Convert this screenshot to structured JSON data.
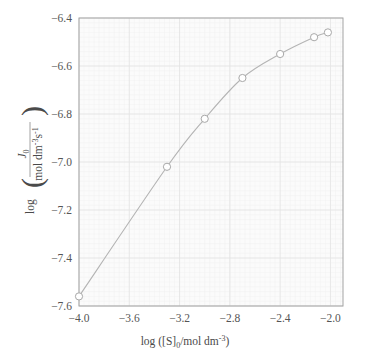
{
  "chart_data": {
    "type": "line",
    "title": "",
    "subtitle": "",
    "xlabel": "log ([S]0/mol dm-3)",
    "ylabel": "log ( J0 / mol dm-3 s-1 )",
    "xlim": [
      -4.0,
      -1.9
    ],
    "ylim": [
      -7.6,
      -6.4
    ],
    "grid": true,
    "legend": null,
    "x_ticks": [
      "-4.0",
      "-3.6",
      "-3.2",
      "-2.8",
      "-2.4",
      "-2.0"
    ],
    "x_tick_values": [
      -4.0,
      -3.6,
      -3.2,
      -2.8,
      -2.4,
      -2.0
    ],
    "y_ticks": [
      "-6.4",
      "-6.6",
      "-6.8",
      "-7.0",
      "-7.2",
      "-7.4",
      "-7.6"
    ],
    "y_tick_values": [
      -6.4,
      -6.6,
      -6.8,
      -7.0,
      -7.2,
      -7.4,
      -7.6
    ],
    "marker": "open-circle",
    "series": [
      {
        "name": "initial rate",
        "x": [
          -4.0,
          -3.3,
          -3.0,
          -2.7,
          -2.4,
          -2.13,
          -2.02
        ],
        "values": [
          -7.56,
          -7.02,
          -6.82,
          -6.65,
          -6.55,
          -6.48,
          -6.46
        ]
      }
    ],
    "colors": {
      "line": "#b4b4b4",
      "marker_edge": "#a8a8a8",
      "marker_face": "#ffffff",
      "grid_major": "#e2e2e2",
      "grid_minor": "#f0f0f0",
      "axis": "#9a9a9a",
      "text": "#555555",
      "plot_background": "#fbfbfb"
    }
  },
  "axis_label_parts": {
    "y_log": "log",
    "y_numerator_J": "J",
    "y_numerator_sub": "0",
    "y_denominator": "mol dm",
    "y_denominator_sup1": "-3",
    "y_denominator_s": "s",
    "y_denominator_sup2": "-1",
    "x_log": "log ([S]",
    "x_sub": "0",
    "x_mid": "/mol dm",
    "x_sup": "-3",
    "x_close": ")"
  }
}
